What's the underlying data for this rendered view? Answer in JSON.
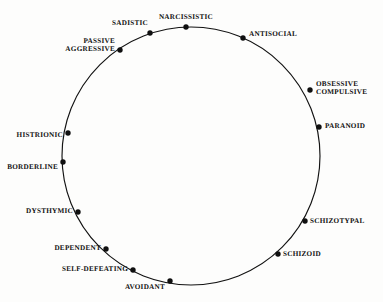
{
  "figure": {
    "background_color": "#fdfdfc",
    "ink_color": "#101010"
  },
  "chart_data": {
    "type": "scatter",
    "title": "",
    "subtitle": "",
    "xlabel": "",
    "ylabel": "",
    "grid": false,
    "legend": "none",
    "layout": "circular-circumplex",
    "circle": {
      "cx": 191,
      "cy": 156,
      "r": 129
    },
    "categories": [
      "NARCISSISTIC",
      "ANTISOCIAL",
      "OBSESSIVE\nCOMPULSIVE",
      "PARANOID",
      "SCHIZOTYPAL",
      "SCHIZOID",
      "AVOIDANT",
      "SELF-DEFEATING",
      "DEPENDENT",
      "DYSTHYMIC",
      "BORDERLINE",
      "HISTRIONIC",
      "PASSIVE\nAGGRESSIVE",
      "SADISTIC"
    ],
    "points": [
      {
        "label": "NARCISSISTIC",
        "angle_deg": 357,
        "x": 186,
        "y": 27,
        "label_x": 186,
        "label_y": 18,
        "anchor": "mid"
      },
      {
        "label": "ANTISOCIAL",
        "angle_deg": 24,
        "x": 243,
        "y": 38,
        "label_x": 249,
        "label_y": 35,
        "anchor": "start"
      },
      {
        "label": "OBSESSIVE\nCOMPULSIVE",
        "angle_deg": 61,
        "x": 310,
        "y": 90,
        "label_x": 316,
        "label_y": 89,
        "anchor": "start"
      },
      {
        "label": "PARANOID",
        "angle_deg": 77,
        "x": 319,
        "y": 127,
        "label_x": 325,
        "label_y": 127,
        "anchor": "start"
      },
      {
        "label": "SCHIZOTYPAL",
        "angle_deg": 118,
        "x": 305,
        "y": 221,
        "label_x": 310,
        "label_y": 222,
        "anchor": "start"
      },
      {
        "label": "SCHIZOID",
        "angle_deg": 135,
        "x": 278,
        "y": 254,
        "label_x": 283,
        "label_y": 255,
        "anchor": "start"
      },
      {
        "label": "AVOIDANT",
        "angle_deg": 189,
        "x": 170,
        "y": 281,
        "label_x": 165,
        "label_y": 288,
        "anchor": "end"
      },
      {
        "label": "SELF-DEFEATING",
        "angle_deg": 205,
        "x": 133,
        "y": 270,
        "label_x": 128,
        "label_y": 270,
        "anchor": "end"
      },
      {
        "label": "DEPENDENT",
        "angle_deg": 220,
        "x": 106,
        "y": 249,
        "label_x": 101,
        "label_y": 249,
        "anchor": "end"
      },
      {
        "label": "DYSTHYMIC",
        "angle_deg": 240,
        "x": 78,
        "y": 212,
        "label_x": 73,
        "label_y": 212,
        "anchor": "end"
      },
      {
        "label": "BORDERLINE",
        "angle_deg": 267,
        "x": 63,
        "y": 162,
        "label_x": 58,
        "label_y": 168,
        "anchor": "end"
      },
      {
        "label": "HISTRIONIC",
        "angle_deg": 280,
        "x": 68,
        "y": 133,
        "label_x": 63,
        "label_y": 136,
        "anchor": "end"
      },
      {
        "label": "PASSIVE\nAGGRESSIVE",
        "angle_deg": 325,
        "x": 120,
        "y": 50,
        "label_x": 115,
        "label_y": 46,
        "anchor": "end"
      },
      {
        "label": "SADISTIC",
        "angle_deg": 342,
        "x": 150,
        "y": 33,
        "label_x": 148,
        "label_y": 24,
        "anchor": "end"
      }
    ]
  }
}
